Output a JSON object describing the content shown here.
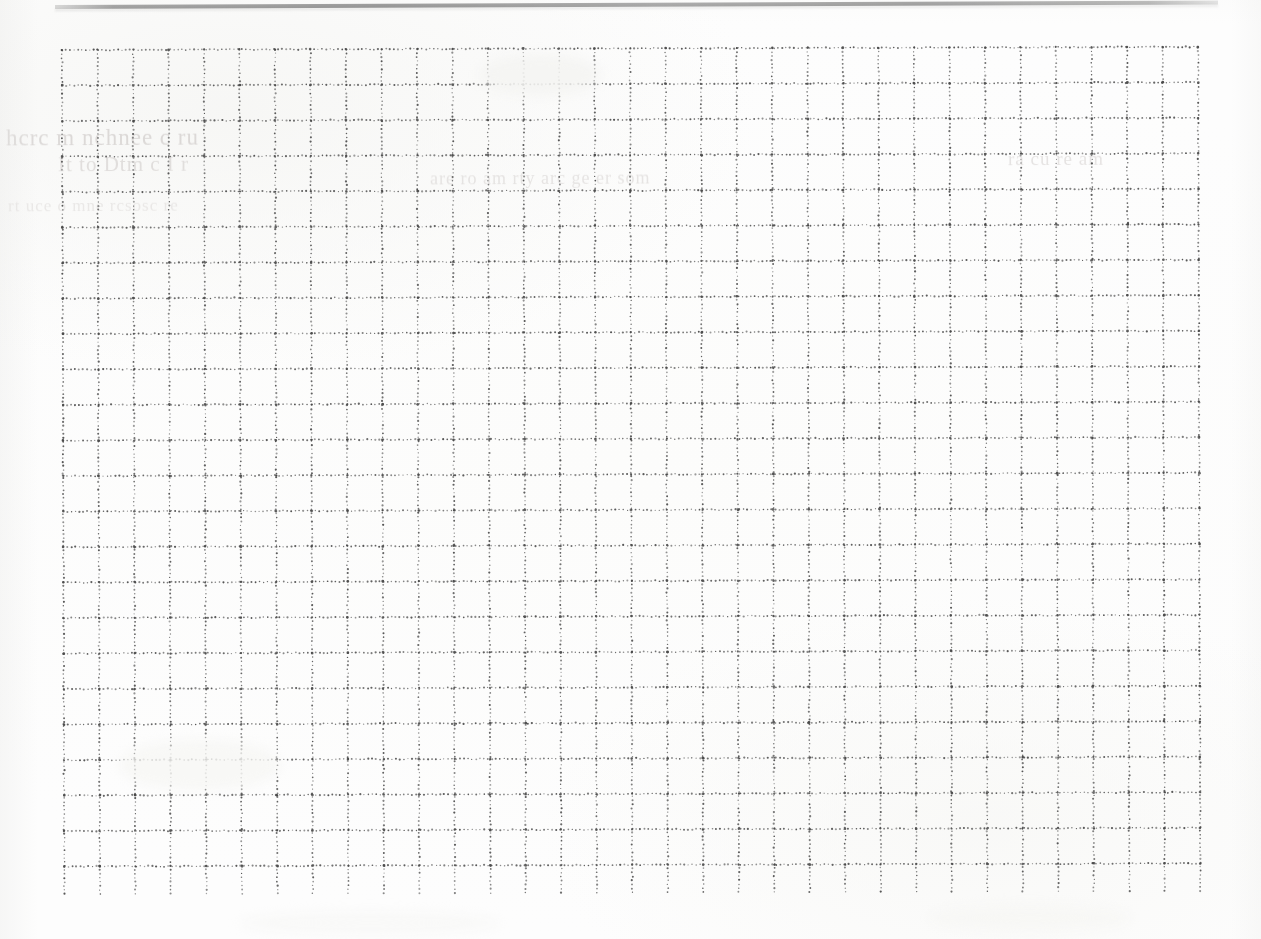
{
  "page": {
    "kind": "scanned-dotted-grid-paper",
    "caption": "Blank scanned page of dotted quadrille grid paper",
    "width": 1261,
    "height": 939,
    "background_color": "#fdfdfd",
    "paper_tint": "#fbfbfa"
  },
  "scan_edge_bar": {
    "name": "page-edge-shadow",
    "color": "#5c5c5c",
    "left": 55,
    "top": 5,
    "width": 1163,
    "height": 4,
    "rotation_deg": -0.22
  },
  "grid": {
    "name": "dotted-quadrille-grid",
    "line_style": "dotted",
    "dot_color": "#4a4a4a",
    "dot_radius": 0.85,
    "dot_spacing": 4.0,
    "cell_size": 35.5,
    "columns": 32,
    "rows": 24,
    "origin_x": 62,
    "origin_y": 50,
    "width": 1139,
    "height": 846,
    "rotation_deg": -0.16
  },
  "ghost_text": {
    "name": "bleed-through-text",
    "legible": false,
    "color": "#c4c0be",
    "lines": [
      "hcrc  m  nchnee  c  ru",
      "It  to  Dtm   c  I   r",
      "are  ro  am  rty  arc  ge  er  som",
      "ra  cu  re  am",
      "rt  uce  o  mne  rcsosc  re"
    ]
  },
  "chart_data": {
    "type": "table",
    "xlabel": "",
    "ylabel": "",
    "columns": 32,
    "rows": 24,
    "grid": true,
    "values": []
  }
}
